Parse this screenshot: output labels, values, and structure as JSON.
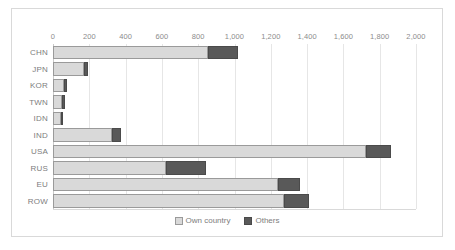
{
  "chart_data": {
    "type": "bar",
    "orientation": "horizontal",
    "stacked": true,
    "title": "",
    "subtitle": "",
    "xlabel": "",
    "ylabel": "",
    "xlim": [
      0,
      2000
    ],
    "xticks": [
      0,
      200,
      400,
      600,
      800,
      1000,
      1200,
      1400,
      1600,
      1800,
      2000
    ],
    "xtick_labels": [
      "0",
      "200",
      "400",
      "600",
      "800",
      "1,000",
      "1,200",
      "1,400",
      "1,600",
      "1,800",
      "2,000"
    ],
    "grid": true,
    "legend_position": "bottom",
    "categories": [
      "CHN",
      "JPN",
      "KOR",
      "TWN",
      "IDN",
      "IND",
      "USA",
      "RUS",
      "EU",
      "ROW"
    ],
    "series": [
      {
        "name": "Own country",
        "color": "#d9d9d9",
        "values": [
          854,
          171,
          61,
          50,
          44,
          325,
          1725,
          622,
          1240,
          1273
        ]
      },
      {
        "name": "Others",
        "color": "#595959",
        "values": [
          165,
          22,
          16,
          16,
          6,
          50,
          137,
          221,
          121,
          138
        ]
      }
    ],
    "totals": [
      1019,
      193,
      77,
      66,
      50,
      375,
      1862,
      843,
      1361,
      1411
    ]
  },
  "legend": {
    "items": [
      {
        "label": "Own country",
        "color": "#d9d9d9"
      },
      {
        "label": "Others",
        "color": "#595959"
      }
    ]
  }
}
